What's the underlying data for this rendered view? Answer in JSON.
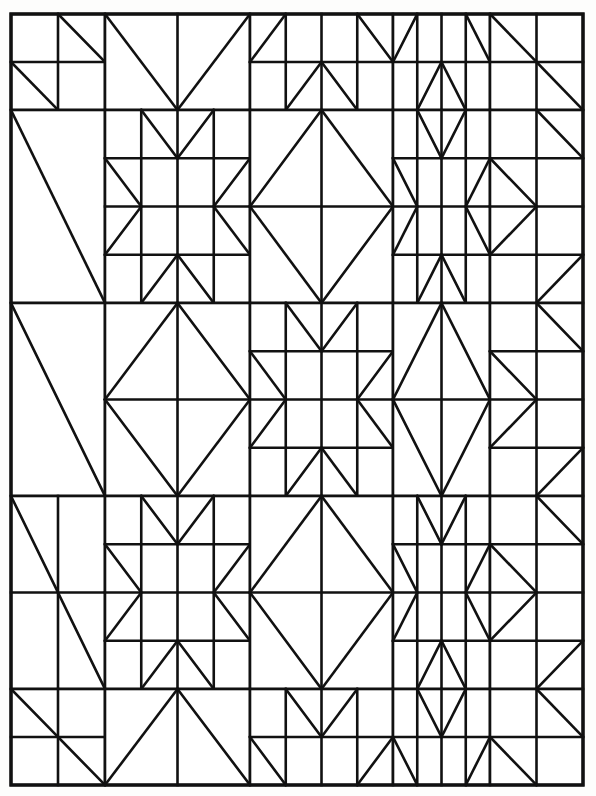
{
  "page": {
    "background_color": "#fdfdfc",
    "line_color": "#111111",
    "fill_color": "#ffffff",
    "width": 596,
    "height": 796
  },
  "grid": {
    "frame": {
      "x0": 11,
      "y0": 14,
      "x1": 583,
      "y1": 785
    },
    "columns": [
      11,
      58,
      105,
      155,
      203,
      250,
      298,
      345,
      393,
      442,
      490,
      537,
      583
    ],
    "rows": [
      14,
      62,
      110,
      158,
      206,
      255,
      303,
      351,
      400,
      448,
      496,
      545,
      593,
      641,
      689,
      737,
      785
    ],
    "block_rows": 5,
    "block_cols": 5,
    "band_sizes_cols": [
      "narrow",
      "wide",
      "wide",
      "wide",
      "narrow"
    ],
    "band_sizes_rows": [
      "narrow",
      "wide",
      "wide",
      "wide",
      "narrow"
    ]
  },
  "blocks": [
    {
      "row": 0,
      "col": 0,
      "name": "corner-pinwheel-block",
      "kind": "corner"
    },
    {
      "row": 0,
      "col": 1,
      "name": "chevron-top-block",
      "kind": "edge-chevron"
    },
    {
      "row": 0,
      "col": 2,
      "name": "sawtooth-top-block",
      "kind": "edge-sawtooth"
    },
    {
      "row": 0,
      "col": 3,
      "name": "sawtooth-top-block",
      "kind": "edge-sawtooth"
    },
    {
      "row": 0,
      "col": 4,
      "name": "corner-pinwheel-block",
      "kind": "corner"
    },
    {
      "row": 1,
      "col": 0,
      "name": "side-halfsquare-block",
      "kind": "edge-half"
    },
    {
      "row": 1,
      "col": 1,
      "name": "star-block",
      "kind": "star"
    },
    {
      "row": 1,
      "col": 2,
      "name": "diamond-block",
      "kind": "diamond"
    },
    {
      "row": 1,
      "col": 3,
      "name": "star-block",
      "kind": "star"
    },
    {
      "row": 1,
      "col": 4,
      "name": "side-sawtooth-block",
      "kind": "edge-sawtooth-v"
    },
    {
      "row": 2,
      "col": 0,
      "name": "side-halfsquare-block",
      "kind": "edge-half"
    },
    {
      "row": 2,
      "col": 1,
      "name": "diamond-block",
      "kind": "diamond"
    },
    {
      "row": 2,
      "col": 2,
      "name": "star-block",
      "kind": "star"
    },
    {
      "row": 2,
      "col": 3,
      "name": "diamond-block",
      "kind": "diamond"
    },
    {
      "row": 2,
      "col": 4,
      "name": "side-sawtooth-block",
      "kind": "edge-sawtooth-v"
    },
    {
      "row": 3,
      "col": 0,
      "name": "corner-pinwheel-block",
      "kind": "corner"
    },
    {
      "row": 3,
      "col": 1,
      "name": "star-block",
      "kind": "star"
    },
    {
      "row": 3,
      "col": 2,
      "name": "diamond-block",
      "kind": "diamond"
    },
    {
      "row": 3,
      "col": 3,
      "name": "star-block",
      "kind": "star"
    },
    {
      "row": 3,
      "col": 4,
      "name": "side-sawtooth-block",
      "kind": "edge-sawtooth-v"
    },
    {
      "row": 4,
      "col": 0,
      "name": "corner-pinwheel-block",
      "kind": "corner"
    },
    {
      "row": 4,
      "col": 1,
      "name": "chevron-bottom-block",
      "kind": "edge-chevron"
    },
    {
      "row": 4,
      "col": 2,
      "name": "sawtooth-bottom-block",
      "kind": "edge-sawtooth"
    },
    {
      "row": 4,
      "col": 3,
      "name": "sawtooth-bottom-block",
      "kind": "edge-sawtooth"
    },
    {
      "row": 4,
      "col": 4,
      "name": "corner-pinwheel-block",
      "kind": "corner"
    }
  ],
  "chart_data": {
    "type": "table",
    "categories": [
      "Block row 1",
      "Block row 2",
      "Block row 3",
      "Block row 4",
      "Block row 5"
    ],
    "series": [
      {
        "name": "Block row 1",
        "values": [
          "corner",
          "chevron",
          "sawtooth",
          "sawtooth",
          "corner"
        ]
      },
      {
        "name": "Block row 2",
        "values": [
          "half-square",
          "star",
          "diamond",
          "star",
          "sawtooth-v"
        ]
      },
      {
        "name": "Block row 3",
        "values": [
          "half-square",
          "diamond",
          "star",
          "diamond",
          "sawtooth-v"
        ]
      },
      {
        "name": "Block row 4",
        "values": [
          "corner",
          "star",
          "diamond",
          "star",
          "sawtooth-v"
        ]
      },
      {
        "name": "Block row 5",
        "values": [
          "corner",
          "chevron",
          "sawtooth",
          "sawtooth",
          "corner"
        ]
      }
    ],
    "xlabel": "",
    "ylabel": "",
    "grid": true,
    "legend": "none"
  }
}
